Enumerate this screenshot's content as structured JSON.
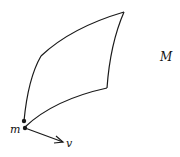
{
  "diagram": {
    "labels": {
      "manifold": "M",
      "point": "m",
      "vector": "v"
    },
    "colors": {
      "stroke": "#1a1a1a",
      "background": "#ffffff"
    }
  }
}
